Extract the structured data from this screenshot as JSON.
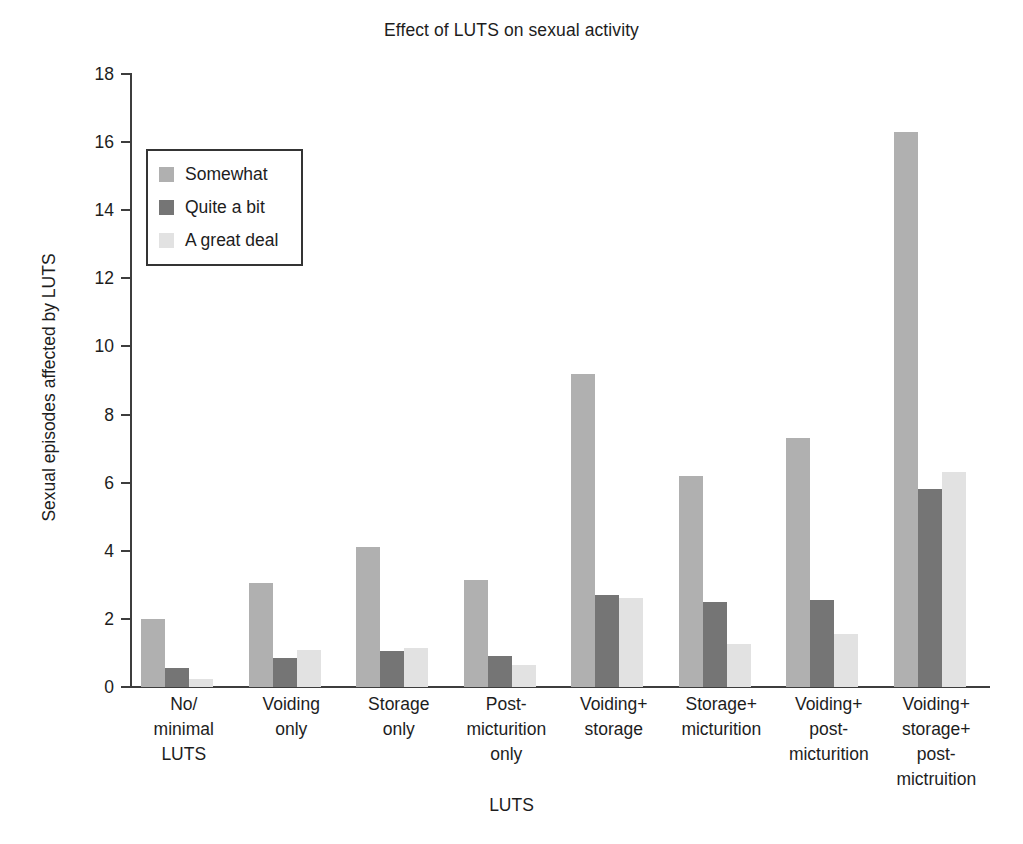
{
  "chart_data": {
    "type": "bar",
    "title": "Effect of LUTS on sexual activity",
    "xlabel": "LUTS",
    "ylabel": "Sexual episodes affected by LUTS",
    "ylim": [
      0,
      18
    ],
    "y_ticks": [
      0,
      2,
      4,
      6,
      8,
      10,
      12,
      14,
      16,
      18
    ],
    "grid": false,
    "legend_position": "upper-left-inside",
    "categories": [
      "No/ minimal LUTS",
      "Voiding only",
      "Storage only",
      "Post- micturition only",
      "Voiding+ storage",
      "Storage+ micturition",
      "Voiding+ post- micturition",
      "Voiding+ storage+ post- mictruition"
    ],
    "category_lines": [
      [
        "No/",
        "minimal",
        "LUTS"
      ],
      [
        "Voiding",
        "only"
      ],
      [
        "Storage",
        "only"
      ],
      [
        "Post-",
        "micturition",
        "only"
      ],
      [
        "Voiding+",
        "storage"
      ],
      [
        "Storage+",
        "micturition"
      ],
      [
        "Voiding+",
        "post-",
        "micturition"
      ],
      [
        "Voiding+",
        "storage+",
        "post-",
        "mictruition"
      ]
    ],
    "series": [
      {
        "name": "Somewhat",
        "color": "#b0b0b0",
        "values": [
          2.0,
          3.05,
          4.1,
          3.15,
          9.2,
          6.2,
          7.3,
          16.3
        ]
      },
      {
        "name": "Quite a bit",
        "color": "#757575",
        "values": [
          0.55,
          0.85,
          1.05,
          0.9,
          2.7,
          2.5,
          2.55,
          5.8
        ]
      },
      {
        "name": "A great deal",
        "color": "#e2e2e2",
        "values": [
          0.25,
          1.1,
          1.15,
          0.65,
          2.6,
          1.25,
          1.55,
          6.3
        ]
      }
    ]
  },
  "axis": {
    "color": "#3d3d3d"
  }
}
